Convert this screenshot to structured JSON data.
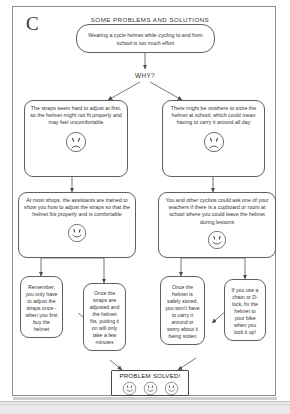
{
  "page": {
    "letter_label": "C",
    "title": "SOME PROBLEMS AND SOLUTIONS",
    "why_label": "WHY?"
  },
  "nodes": {
    "root": {
      "text": "Wearing a cycle helmet while cycling to and from school is too much effort",
      "face": "none"
    },
    "problem_left": {
      "text": "The straps seem hard to adjust at first, so the helmet might not fit properly and may feel uncomfortable",
      "face": "sad"
    },
    "problem_right": {
      "text": "There might be nowhere to store the helmet at school, which could mean having to carry it around all day",
      "face": "sad"
    },
    "solution_left": {
      "text": "At most shops, the assistants are trained to show you how to adjust the straps so that the helmet fits properly and is comfortable",
      "face": "happy"
    },
    "solution_right": {
      "text": "You and other cyclists could ask one of your teachers if there is a cupboard or room at school where you could leave the helmet during lessons",
      "face": "happy"
    },
    "detail_1": {
      "text": "Remember, you only have to adjust the straps once - when you first buy the helmet",
      "face": "none"
    },
    "detail_2": {
      "text": "Once the straps are adjusted and the helmet fits, putting it on will only take a few minutes",
      "face": "none"
    },
    "detail_3": {
      "text": "Once the helmet is safely stored, you won't have to carry it around or worry about it being stolen",
      "face": "none"
    },
    "detail_4": {
      "text": "If you use a chain or D-lock, fix the helmet to your bike when you lock it up!",
      "face": "none"
    }
  },
  "outcome": {
    "label": "PROBLEM SOLVED!",
    "face_count": 3,
    "face": "happy"
  },
  "colors": {
    "ink": "#333333",
    "stroke": "#5f5f5f",
    "frame": "#8d8d8d",
    "paper": "#ffffff",
    "band": "#e9e9e9"
  }
}
